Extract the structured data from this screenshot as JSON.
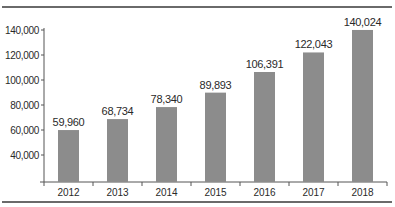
{
  "chart_data": {
    "type": "bar",
    "title": "",
    "xlabel": "",
    "ylabel": "",
    "categories": [
      "2012",
      "2013",
      "2014",
      "2015",
      "2016",
      "2017",
      "2018"
    ],
    "values": [
      59960,
      68734,
      78340,
      89893,
      106391,
      122043,
      140024
    ],
    "value_labels": [
      "59,960",
      "68,734",
      "78,340",
      "89,893",
      "106,391",
      "122,043",
      "140,024"
    ],
    "yticks": [
      40000,
      60000,
      80000,
      100000,
      120000,
      140000
    ],
    "ytick_labels": [
      "40,000",
      "60,000",
      "80,000",
      "100,000",
      "120,000",
      "140,000"
    ],
    "ylim": [
      18400,
      145000
    ],
    "grid": false,
    "legend": null,
    "colors": {
      "bar": "#8c8c8c",
      "axis": "#555555",
      "frame": "#6a6a6a",
      "text": "#2a2a2a"
    }
  }
}
